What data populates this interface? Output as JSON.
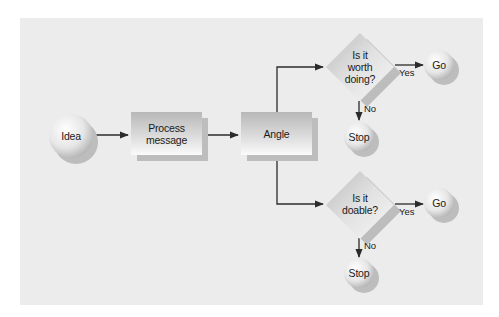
{
  "diagram": {
    "type": "flowchart",
    "colors": {
      "background": "#ffffff",
      "panel": "#ececec",
      "shape_light": "#f8f8f8",
      "shape_dark": "#b9b9b9",
      "shadow": "#bdbdbd",
      "line": "#2b2b2b"
    },
    "nodes": {
      "idea": {
        "label": "Idea",
        "shape": "circle"
      },
      "process": {
        "label": "Process message",
        "line1": "Process",
        "line2": "message",
        "shape": "rectangle"
      },
      "angle": {
        "label": "Angle",
        "shape": "rectangle"
      },
      "worth": {
        "label": "Is it worth doing?",
        "line1": "Is it",
        "line2": "worth",
        "line3": "doing?",
        "shape": "diamond"
      },
      "worth_go": {
        "label": "Go",
        "shape": "circle"
      },
      "worth_stop": {
        "label": "Stop",
        "shape": "circle"
      },
      "doable": {
        "label": "Is it doable?",
        "line1": "Is it",
        "line2": "doable?",
        "shape": "diamond"
      },
      "doable_go": {
        "label": "Go",
        "shape": "circle"
      },
      "doable_stop": {
        "label": "Stop",
        "shape": "circle"
      }
    },
    "edges": [
      {
        "from": "idea",
        "to": "process",
        "label": ""
      },
      {
        "from": "process",
        "to": "angle",
        "label": ""
      },
      {
        "from": "angle",
        "to": "worth",
        "label": ""
      },
      {
        "from": "angle",
        "to": "doable",
        "label": ""
      },
      {
        "from": "worth",
        "to": "worth_go",
        "label": "Yes"
      },
      {
        "from": "worth",
        "to": "worth_stop",
        "label": "No"
      },
      {
        "from": "doable",
        "to": "doable_go",
        "label": "Yes"
      },
      {
        "from": "doable",
        "to": "doable_stop",
        "label": "No"
      }
    ],
    "edge_labels": {
      "worth_yes": "Yes",
      "worth_no": "No",
      "doable_yes": "Yes",
      "doable_no": "No"
    }
  }
}
